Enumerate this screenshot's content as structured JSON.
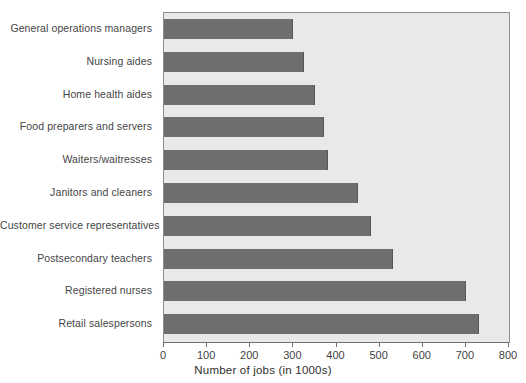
{
  "chart_data": {
    "type": "bar",
    "orientation": "horizontal",
    "title": "",
    "xlabel": "Number of jobs (in 1000s)",
    "ylabel": "",
    "xlim": [
      0,
      800
    ],
    "xticks": [
      0,
      100,
      200,
      300,
      400,
      500,
      600,
      700,
      800
    ],
    "grid": false,
    "legend": null,
    "categories": [
      "General operations managers",
      "Nursing aides",
      "Home health aides",
      "Food preparers and servers",
      "Waiters/waitresses",
      "Janitors and cleaners",
      "Customer service representatives",
      "Postsecondary teachers",
      "Registered nurses",
      "Retail salespersons"
    ],
    "values": [
      300,
      325,
      350,
      370,
      380,
      450,
      480,
      530,
      700,
      730
    ],
    "series": [
      {
        "name": "Number of jobs (in 1000s)",
        "values": [
          300,
          325,
          350,
          370,
          380,
          450,
          480,
          530,
          700,
          730
        ]
      }
    ],
    "colors": {
      "bar": "#6e6e6e",
      "plot_background": "#e9e9e9",
      "axis": "#6f6f6f",
      "text": "#3a3a3a"
    }
  },
  "axis": {
    "x_tick_labels": [
      "0",
      "100",
      "200",
      "300",
      "400",
      "500",
      "600",
      "700",
      "800"
    ],
    "x_title": "Number of jobs (in 1000s)"
  }
}
